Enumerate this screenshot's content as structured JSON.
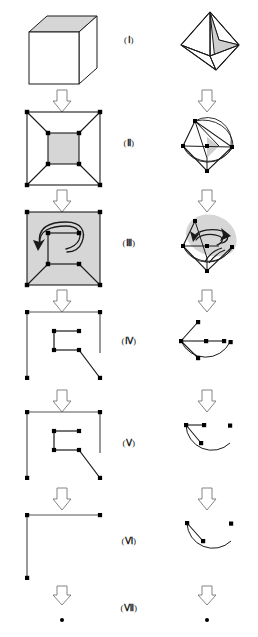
{
  "figure": {
    "stage_labels": [
      {
        "id": "I",
        "text": "(Ⅰ)",
        "open": "(",
        "num": "Ⅰ",
        "close": ")",
        "y": 40
      },
      {
        "id": "II",
        "text": "(Ⅱ)",
        "open": "(",
        "num": "Ⅱ",
        "close": ")",
        "y": 142
      },
      {
        "id": "III",
        "text": "(Ⅲ)",
        "open": "(",
        "num": "Ⅲ",
        "close": ")",
        "y": 242
      },
      {
        "id": "IV",
        "text": "(Ⅳ)",
        "open": "(",
        "num": "Ⅳ",
        "close": ")",
        "y": 340
      },
      {
        "id": "V",
        "text": "(Ⅴ)",
        "open": "(",
        "num": "Ⅴ",
        "close": ")",
        "y": 442
      },
      {
        "id": "VI",
        "text": "(Ⅵ)",
        "open": "(",
        "num": "Ⅵ",
        "close": ")",
        "y": 540
      },
      {
        "id": "VII",
        "text": "(Ⅶ)",
        "open": "(",
        "num": "Ⅶ",
        "close": ")",
        "y": 607
      }
    ],
    "colors": {
      "stroke": "#1a1a1a",
      "shade": "#d2d2d2",
      "shade_light": "#dcdcdc",
      "arrow_fill": "#ffffff",
      "background": "#ffffff",
      "vertex": "#000000"
    },
    "columns": [
      {
        "id": "left",
        "name": "cube-column",
        "shape": "cube"
      },
      {
        "id": "right",
        "name": "octahedron-column",
        "shape": "octahedron"
      }
    ],
    "stages": {
      "I": {
        "left": "cube-solid",
        "right": "octahedron-solid"
      },
      "II": {
        "left": "cube-planar-graph",
        "right": "octahedron-planar-graph"
      },
      "III": {
        "left": "cube-graph-with-contraction-arrow",
        "right": "octahedron-graph-with-contraction-arrow"
      },
      "IV": {
        "left": "cube-tree-stage-4",
        "right": "octahedron-tree-stage-4"
      },
      "V": {
        "left": "cube-tree-stage-5",
        "right": "octahedron-tree-stage-5"
      },
      "VI": {
        "left": "cube-tree-stage-6",
        "right": "octahedron-tree-stage-6"
      },
      "VII": {
        "left": "single-vertex",
        "right": "single-vertex"
      }
    },
    "arrows": {
      "glyph": "double-down-arrow",
      "count_left": 6,
      "count_right": 6,
      "left_x": 62,
      "right_x": 207,
      "y_positions": [
        93,
        192,
        292,
        392,
        490,
        575
      ]
    }
  }
}
